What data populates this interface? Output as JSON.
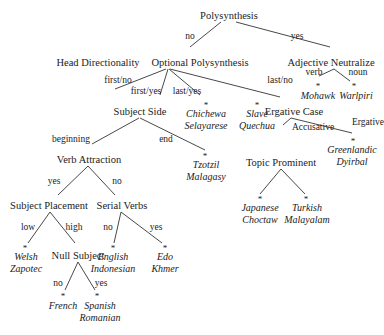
{
  "title": "Polysynthesis",
  "nodes": {
    "polysynthesis": "Polysynthesis",
    "head_directionality": "Head Directionality",
    "optional_polysynthesis": "Optional Polysynthesis",
    "adjective_neutralize": "Adjective Neutralize",
    "subject_side": "Subject Side",
    "ergative_case": "Ergative Case",
    "verb_attraction": "Verb Attraction",
    "topic_prominent": "Topic Prominent",
    "subject_placement": "Subject Placement",
    "serial_verbs": "Serial Verbs",
    "null_subject": "Null Subject"
  },
  "edges": {
    "poly_no": "no",
    "poly_yes": "yes",
    "opt_first_no": "first/no",
    "opt_first_yes": "first/yes",
    "opt_last_yes": "last/yes",
    "opt_last_no": "last/no",
    "adj_verb": "verb",
    "adj_noun": "noun",
    "side_beginning": "beginning",
    "side_end": "end",
    "erg_accusative": "Accusative",
    "erg_ergative": "Ergative",
    "va_yes": "yes",
    "va_no": "no",
    "sp_low": "low",
    "sp_high": "high",
    "sv_no": "no",
    "sv_yes": "yes",
    "ns_no": "no",
    "ns_yes": "yes"
  },
  "leaves": {
    "mohawk": [
      "Mohawk"
    ],
    "warlpiri": [
      "Warlpiri"
    ],
    "chichewa": [
      "Chichewa",
      "Selayarese"
    ],
    "slave": [
      "Slave",
      "Quechua"
    ],
    "greenlandic": [
      "Greenlandic",
      "Dyirbal"
    ],
    "tzotzil": [
      "Tzotzil",
      "Malagasy"
    ],
    "japanese": [
      "Japanese",
      "Choctaw"
    ],
    "turkish": [
      "Turkish",
      "Malayalam"
    ],
    "welsh": [
      "Welsh",
      "Zapotec"
    ],
    "english": [
      "English",
      "Indonesian"
    ],
    "edo": [
      "Edo",
      "Khmer"
    ],
    "french": [
      "French"
    ],
    "spanish": [
      "Spanish",
      "Romanian"
    ]
  },
  "leaf_marker": "*"
}
